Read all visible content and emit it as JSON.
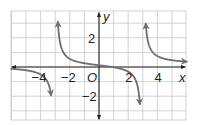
{
  "chart_data": {
    "type": "line",
    "title": "",
    "xlabel": "x",
    "ylabel": "y",
    "origin_label": "O",
    "xlim": [
      -6,
      6
    ],
    "ylim": [
      -3.6,
      3.8
    ],
    "grid": true,
    "x_ticks": [
      {
        "value": -4,
        "label": "−4"
      },
      {
        "value": -2,
        "label": "−2"
      },
      {
        "value": 2,
        "label": "2"
      },
      {
        "value": 4,
        "label": "4"
      }
    ],
    "y_ticks": [
      {
        "value": 2,
        "label": "2"
      },
      {
        "value": -2,
        "label": "−2"
      }
    ],
    "vertical_asymptotes": [
      -3,
      3
    ],
    "horizontal_asymptote": 0,
    "series": [
      {
        "name": "left-branch",
        "x": [
          -6,
          -5,
          -4.5,
          -4,
          -3.6,
          -3.35
        ],
        "y": [
          -0.22,
          -0.31,
          -0.4,
          -0.57,
          -0.91,
          -1.5
        ],
        "ends_with_arrow": "down"
      },
      {
        "name": "middle-branch",
        "x": [
          -2.75,
          -2.5,
          -2,
          -1,
          0,
          1,
          2,
          2.3,
          2.5,
          2.75
        ],
        "y": [
          3.8,
          2.4,
          1.35,
          0.6,
          0.3,
          0.15,
          -0.1,
          -0.3,
          -0.9,
          -3.6
        ],
        "ends_with_arrow": "both"
      },
      {
        "name": "right-branch",
        "x": [
          3.05,
          3.25,
          3.5,
          4,
          5,
          6
        ],
        "y": [
          3.8,
          1.6,
          0.9,
          0.55,
          0.35,
          0.25
        ],
        "ends_with_arrow": "both"
      }
    ],
    "colors": {
      "grid": "#c8c8c8",
      "axis": "#231f20",
      "curve": "#6d6e70"
    }
  }
}
